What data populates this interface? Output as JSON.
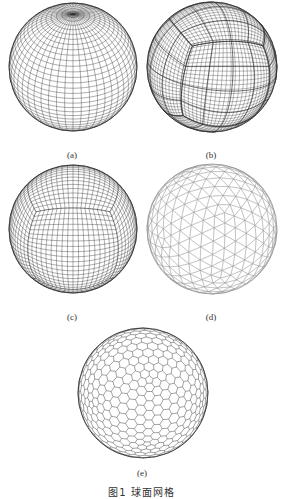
{
  "figure": {
    "caption": "图1  球面网格",
    "panels": [
      {
        "id": "a",
        "label": "(a)",
        "mesh": "latitude-longitude grid",
        "cx": 72,
        "cy": 65,
        "r": 64,
        "label_y": 150
      },
      {
        "id": "b",
        "label": "(b)",
        "mesh": "cubed-sphere grid (overlapping)",
        "cx": 211,
        "cy": 65,
        "r": 65,
        "label_y": 150
      },
      {
        "id": "c",
        "label": "(c)",
        "mesh": "cubed-sphere grid",
        "cx": 72,
        "cy": 228,
        "r": 64,
        "label_y": 312
      },
      {
        "id": "d",
        "label": "(d)",
        "mesh": "icosahedral triangular grid",
        "cx": 211,
        "cy": 228,
        "r": 65,
        "label_y": 312
      },
      {
        "id": "e",
        "label": "(e)",
        "mesh": "hexagonal geodesic grid",
        "cx": 142,
        "cy": 392,
        "r": 65,
        "label_y": 468
      }
    ]
  },
  "colors": {
    "background": "#ffffff",
    "mesh_dark": "#333333",
    "mesh_light": "#999999",
    "text": "#333333"
  }
}
